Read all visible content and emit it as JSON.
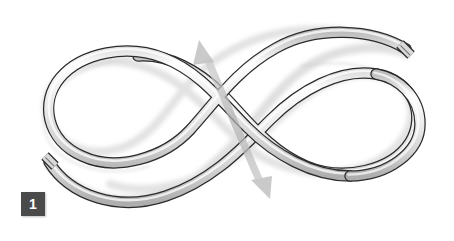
{
  "figure": {
    "background_color": "#ffffff",
    "width": 454,
    "height": 241
  },
  "step_badge": {
    "number": "1",
    "background_color": "#4a4a4a",
    "text_color": "#ffffff"
  },
  "rope": {
    "name": "rope",
    "fill_color": "#e2e2e2",
    "highlight_color": "#fbfbfb",
    "outline_color": "#2b2b2b",
    "shadow_color": "#c9c9c9",
    "thickness_px": 9,
    "description": "A single length of rope crossed over itself forming two loops in a figure-eight / pretzel shape",
    "end_left": {
      "name": "rope-end-left",
      "label": "cut end",
      "x": 49,
      "y": 162
    },
    "end_right": {
      "name": "rope-end-right",
      "label": "cut end",
      "x": 406,
      "y": 49
    }
  },
  "direction_arrow": {
    "name": "direction-arrow",
    "type": "double-headed",
    "color": "#b5b5b5",
    "start": {
      "x": 199,
      "y": 44
    },
    "end": {
      "x": 268,
      "y": 196
    },
    "head_top_label": "up-left arrowhead",
    "head_bottom_label": "down-right arrowhead"
  }
}
